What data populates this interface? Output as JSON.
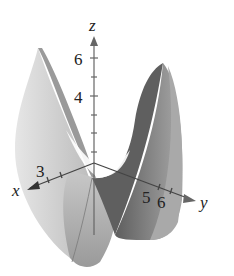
{
  "figure": {
    "axes": {
      "x": {
        "label": "x",
        "ticks": [
          "3"
        ]
      },
      "y": {
        "label": "y",
        "ticks": [
          "5",
          "6"
        ]
      },
      "z": {
        "label": "z",
        "ticks": [
          "4",
          "6"
        ]
      }
    },
    "colors": {
      "light_surface": "#d9d9d9",
      "mid_surface": "#a6a6a6",
      "dark_surface": "#6e6e6e",
      "axis": "#555555",
      "background": "#ffffff"
    }
  }
}
